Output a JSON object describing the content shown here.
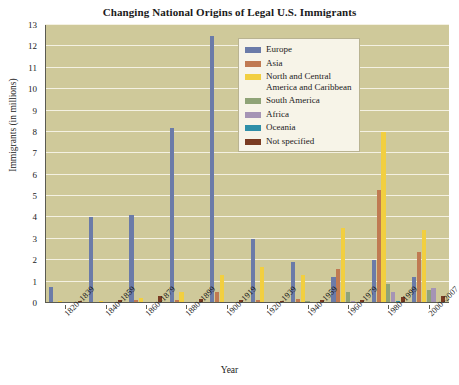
{
  "chart_data": {
    "type": "bar",
    "title": "Changing National Origins of Legal U.S. Immigrants",
    "xlabel": "Year",
    "ylabel": "Immigrants (in millions)",
    "ylim": [
      0,
      13
    ],
    "yticks": [
      0,
      1,
      2,
      3,
      4,
      5,
      6,
      7,
      8,
      9,
      10,
      11,
      12,
      13
    ],
    "grid": true,
    "legend_position": "inside-top-center",
    "categories": [
      "1820–1839",
      "1840–1859",
      "1860–1879",
      "1880–1899",
      "1900–1919",
      "1920–1939",
      "1940–1959",
      "1960–1979",
      "1980–1999",
      "2000–2007"
    ],
    "series": [
      {
        "name": "Europe",
        "color": "#6b7ba8",
        "values": [
          0.75,
          4.0,
          4.1,
          8.2,
          12.5,
          3.0,
          1.9,
          1.2,
          2.0,
          1.2
        ]
      },
      {
        "name": "Asia",
        "color": "#c07a52",
        "values": [
          0.0,
          0.0,
          0.15,
          0.15,
          0.5,
          0.15,
          0.2,
          1.6,
          5.3,
          2.4
        ]
      },
      {
        "name": "North and Central America and Caribbean",
        "color": "#f2cf40",
        "values": [
          0.1,
          0.1,
          0.25,
          0.5,
          1.3,
          1.7,
          1.3,
          3.5,
          8.0,
          3.4
        ]
      },
      {
        "name": "South America",
        "color": "#8fa377",
        "values": [
          0.0,
          0.0,
          0.0,
          0.0,
          0.05,
          0.05,
          0.1,
          0.5,
          0.9,
          0.6
        ]
      },
      {
        "name": "Africa",
        "color": "#a594b5",
        "values": [
          0.0,
          0.0,
          0.0,
          0.0,
          0.0,
          0.0,
          0.02,
          0.1,
          0.5,
          0.7
        ]
      },
      {
        "name": "Oceania",
        "color": "#2f8fa8",
        "values": [
          0.0,
          0.0,
          0.0,
          0.0,
          0.05,
          0.02,
          0.02,
          0.05,
          0.1,
          0.07
        ]
      },
      {
        "name": "Not specified",
        "color": "#7a3b22",
        "values": [
          0.08,
          0.12,
          0.35,
          0.2,
          0.15,
          0.1,
          0.15,
          0.15,
          0.3,
          0.35
        ]
      }
    ]
  }
}
